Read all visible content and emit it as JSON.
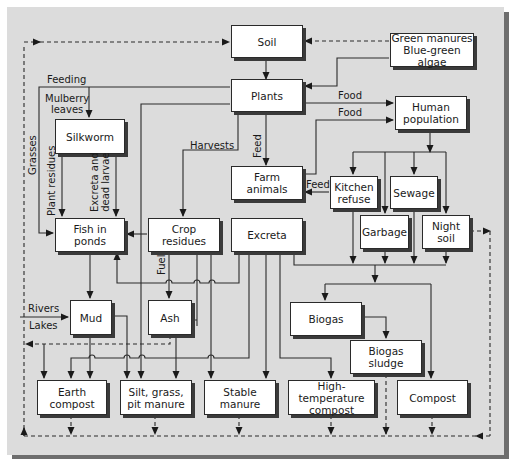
{
  "diagram": {
    "type": "flow-diagram",
    "nodes": {
      "soil": "Soil",
      "green_manures": "Green manures\nBlue-green algae",
      "plants": "Plants",
      "human_population": "Human\npopulation",
      "silkworm": "Silkworm",
      "farm_animals": "Farm\nanimals",
      "kitchen_refuse": "Kitchen\nrefuse",
      "sewage": "Sewage",
      "garbage": "Garbage",
      "night_soil": "Night\nsoil",
      "fish_in_ponds": "Fish in\nponds",
      "crop_residues": "Crop\nresidues",
      "excreta": "Excreta",
      "mud": "Mud",
      "ash": "Ash",
      "biogas": "Biogas",
      "biogas_sludge": "Biogas\nsludge",
      "earth_compost": "Earth\ncompost",
      "silt_grass_pit_manure": "Silt, grass,\npit manure",
      "stable_manure": "Stable\nmanure",
      "high_temperature_compost": "High-temperature\ncompost",
      "compost": "Compost"
    },
    "edge_labels": {
      "feeding": "Feeding",
      "mulberry_leaves": "Mulberry\nleaves",
      "grasses": "Grasses",
      "plant_residues": "Plant residues",
      "excreta_and_dead_larvae": "Excreta and\ndead larvae",
      "harvests": "Harvests",
      "feed_vertical": "Feed",
      "feed_horizontal": "Feed",
      "food_1": "Food",
      "food_2": "Food",
      "fuel": "Fuel",
      "rivers": "Rivers",
      "lakes": "Lakes"
    },
    "edges": [
      {
        "from": "Soil",
        "to": "Plants",
        "style": "solid"
      },
      {
        "from": "Green manures Blue-green algae",
        "to": "Soil",
        "style": "dashed"
      },
      {
        "from": "Green manures Blue-green algae",
        "to": "Plants",
        "style": "solid"
      },
      {
        "from": "Plants",
        "to": "Human population",
        "label": "Food",
        "style": "solid"
      },
      {
        "from": "Farm animals",
        "to": "Human population",
        "label": "Food",
        "style": "solid"
      },
      {
        "from": "Plants",
        "to": "Silkworm",
        "label": "Feeding / Mulberry leaves",
        "style": "solid"
      },
      {
        "from": "Plants",
        "to": "Fish in ponds",
        "label": "Grasses",
        "style": "solid"
      },
      {
        "from": "Plants",
        "to": "Crop residues",
        "label": "Harvests",
        "style": "solid"
      },
      {
        "from": "Plants",
        "to": "Farm animals",
        "label": "Feed",
        "style": "solid"
      },
      {
        "from": "Silkworm",
        "to": "Fish in ponds",
        "label": "Plant residues",
        "style": "solid"
      },
      {
        "from": "Silkworm",
        "to": "Fish in ponds",
        "label": "Excreta and dead larvae",
        "style": "solid"
      },
      {
        "from": "Human population",
        "to": "Kitchen refuse",
        "style": "solid"
      },
      {
        "from": "Human population",
        "to": "Garbage",
        "style": "solid"
      },
      {
        "from": "Human population",
        "to": "Sewage",
        "style": "solid"
      },
      {
        "from": "Human population",
        "to": "Night soil",
        "style": "solid"
      },
      {
        "from": "Kitchen refuse",
        "to": "Farm animals",
        "label": "Feed",
        "style": "solid"
      },
      {
        "from": "Farm animals",
        "to": "Excreta",
        "style": "solid"
      },
      {
        "from": "Crop residues",
        "to": "Fish in ponds",
        "style": "solid"
      },
      {
        "from": "Excreta",
        "to": "Fish in ponds",
        "style": "solid"
      },
      {
        "from": "Crop residues",
        "to": "Ash",
        "label": "Fuel",
        "style": "solid"
      },
      {
        "from": "Fish in ponds",
        "to": "Mud",
        "style": "solid"
      },
      {
        "from": "Rivers / Lakes",
        "to": "Mud",
        "style": "solid"
      },
      {
        "from": "Excreta / Kitchen refuse / Garbage / Sewage / Night soil",
        "to": "Biogas",
        "style": "solid"
      },
      {
        "from": "Excreta / Kitchen refuse / Garbage / Sewage / Night soil",
        "to": "Compost",
        "style": "solid"
      },
      {
        "from": "Biogas",
        "to": "Biogas sludge",
        "style": "solid"
      },
      {
        "from": "Night soil",
        "to": "return loop",
        "style": "dashed"
      },
      {
        "from": "Mud",
        "to": "Earth compost",
        "style": "solid"
      },
      {
        "from": "Mud",
        "to": "Silt, grass, pit manure",
        "style": "solid"
      },
      {
        "from": "Ash",
        "to": "Earth compost",
        "style": "solid"
      },
      {
        "from": "Ash",
        "to": "return loop",
        "style": "dashed"
      },
      {
        "from": "Plants",
        "to": "Silt, grass, pit manure",
        "style": "solid"
      },
      {
        "from": "Crop residues",
        "to": "Silt, grass, pit manure",
        "style": "solid"
      },
      {
        "from": "Crop residues",
        "to": "Stable manure",
        "style": "solid"
      },
      {
        "from": "Excreta",
        "to": "Stable manure",
        "style": "solid"
      },
      {
        "from": "Excreta",
        "to": "High-temperature compost",
        "style": "solid"
      },
      {
        "from": "Bottom products",
        "to": "Soil",
        "style": "dashed"
      }
    ]
  }
}
